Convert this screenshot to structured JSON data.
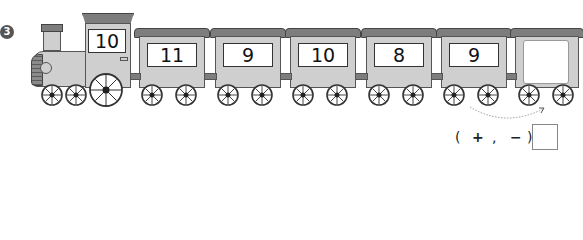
{
  "problem": {
    "number": "3",
    "locomotive_value": "10",
    "cars": [
      {
        "value": "11"
      },
      {
        "value": "9"
      },
      {
        "value": "10"
      },
      {
        "value": "8"
      },
      {
        "value": "9"
      },
      {
        "value": ""
      }
    ],
    "operator_choice": {
      "open": "(",
      "plus": "+",
      "comma": ",",
      "minus": "−",
      "close": ")"
    },
    "answer_box": ""
  },
  "colors": {
    "car_body": "#cfcfcf",
    "roof": "#7d7d7d",
    "outline": "#444444",
    "panel": "#ffffff"
  }
}
